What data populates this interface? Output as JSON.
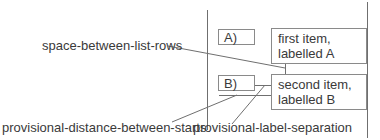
{
  "diagram": {
    "labels": {
      "marker_a": "A)",
      "marker_b": "B)",
      "item_a_line1": "first item,",
      "item_a_line2": "labelled A",
      "item_b_line1": "second item,",
      "item_b_line2": "labelled B"
    },
    "annotations": {
      "space_between_list_rows": "space-between-list-rows",
      "provisional_distance_between_starts": "provisional-distance-between-starts",
      "provisional_label_separation": "provisional-label-separation"
    },
    "colors": {
      "line": "#6f6f6f",
      "box_border": "#8a8a8a",
      "text": "#3a3a3a"
    }
  }
}
